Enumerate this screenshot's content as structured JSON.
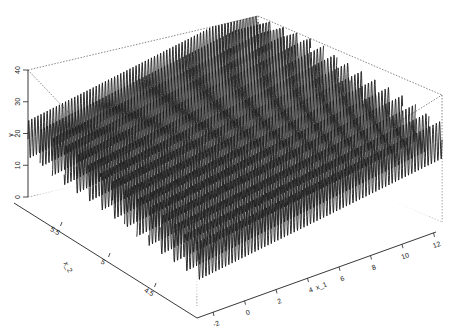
{
  "chart_data": {
    "type": "surface-3d-wireframe",
    "title": "",
    "xlabel": "x_1",
    "ylabel": "x_2",
    "zlabel": "y",
    "x_ticks": [
      "-2",
      "0",
      "2",
      "4",
      "6",
      "8",
      "10",
      "12"
    ],
    "x_range": [
      -2.5,
      12
    ],
    "y_ticks": [
      "4.5",
      "5",
      "5.5"
    ],
    "y_range": [
      4.2,
      5.8
    ],
    "z_ticks": [
      "0",
      "10",
      "20",
      "30",
      "40"
    ],
    "z_range": [
      0,
      40
    ],
    "surface": {
      "description": "Highly oscillatory sinusoidal surface over x_1; mean level rises from ~20 at x_1=-2 to ~30 at x_1=12 near the back, oscillation amplitude ~7 with ~75 cycles across x_1",
      "base_low": 18,
      "base_high": 30,
      "amplitude": 6,
      "cycles": 75,
      "rows": 14
    },
    "line_color": "#1a1a1a",
    "box_color": "#555555",
    "grid": false,
    "legend": null
  }
}
